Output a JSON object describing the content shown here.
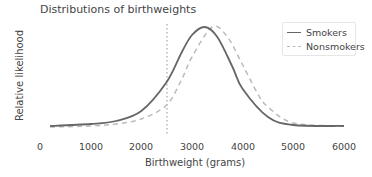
{
  "chart_data": {
    "type": "line",
    "title": "Distributions of birthweights",
    "xlabel": "Birthweight (grams)",
    "ylabel": "Relative likelihood",
    "xlim": [
      0,
      6000
    ],
    "xticks": [
      "0",
      "1000",
      "2000",
      "3000",
      "4000",
      "5000",
      "6000"
    ],
    "yticks": [],
    "grid": false,
    "legend_position": "upper right",
    "reference_line": {
      "x": 2500,
      "style": "dotted",
      "color": "#aaaaaa"
    },
    "series": [
      {
        "name": "Smokers",
        "style": "solid",
        "color": "#666666",
        "x": [
          200,
          1000,
          1500,
          2000,
          2500,
          2800,
          3000,
          3250,
          3500,
          3800,
          4000,
          4500,
          5000,
          6000
        ],
        "relative_likelihood": [
          0.01,
          0.03,
          0.06,
          0.16,
          0.45,
          0.75,
          0.92,
          1.0,
          0.9,
          0.6,
          0.38,
          0.1,
          0.02,
          0.01
        ]
      },
      {
        "name": "Nonsmokers",
        "style": "dashed",
        "color": "#bbbbbb",
        "x": [
          200,
          1000,
          1500,
          2000,
          2500,
          2800,
          3000,
          3400,
          3700,
          4000,
          4300,
          4500,
          5000,
          6000
        ],
        "relative_likelihood": [
          0.0,
          0.01,
          0.03,
          0.08,
          0.22,
          0.48,
          0.7,
          1.0,
          0.9,
          0.62,
          0.33,
          0.2,
          0.04,
          0.01
        ]
      }
    ]
  },
  "legend": {
    "items": [
      {
        "label": "Smokers"
      },
      {
        "label": "Nonsmokers"
      }
    ]
  }
}
